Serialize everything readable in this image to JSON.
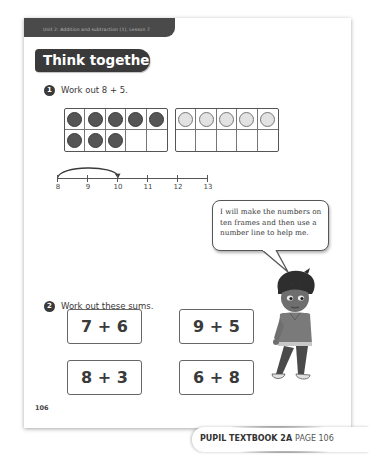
{
  "header": {
    "unit_label": "Unit 2: Addition and subtraction (1), Lesson 7",
    "section_title": "Think together"
  },
  "question1": {
    "number": "1",
    "prompt": "Work out 8 + 5.",
    "ten_frames": [
      {
        "filled": 8,
        "style": "dark",
        "capacity": 10
      },
      {
        "filled": 5,
        "style": "light",
        "capacity": 10
      }
    ],
    "number_line": {
      "labels": [
        "8",
        "9",
        "10",
        "11",
        "12",
        "13"
      ],
      "jump": {
        "from": "8",
        "to": "10"
      }
    }
  },
  "speech_bubble": {
    "text": "I will make the numbers on ten frames and then use a number line to help me."
  },
  "question2": {
    "number": "2",
    "prompt": "Work out these sums.",
    "sums": [
      "7 + 6",
      "9 + 5",
      "8 + 3",
      "6 + 8"
    ]
  },
  "page_number": "106",
  "footer": {
    "book": "PUPIL TEXTBOOK 2A",
    "page": "PAGE 106"
  },
  "colors": {
    "banner": "#3a3a3a",
    "header_bar": "#4a4a4a",
    "counter_dark": "#555555",
    "counter_light": "#e2e2e2"
  }
}
